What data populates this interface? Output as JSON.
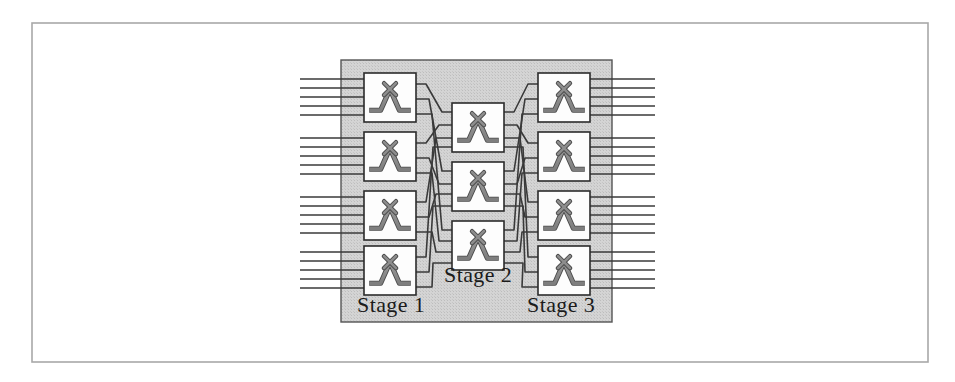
{
  "figure": {
    "outer_border": {
      "x": 32,
      "y": 23,
      "width": 896,
      "height": 339,
      "stroke": "#a8a8a8",
      "stroke_width": 1.6,
      "fill": "#ffffff"
    },
    "panel": {
      "x": 341,
      "y": 60,
      "width": 271,
      "height": 262,
      "fill": "#d2d2d2",
      "stroke": "#555555",
      "stroke_width": 1.4,
      "description": "halftone gray background panel enclosing all three stages"
    },
    "ink_color": "#303030",
    "line_color": "#3a3a3a",
    "switch_box": {
      "fill": "#fdfdfd",
      "stroke": "#2b2b2b",
      "stroke_width": 1.6,
      "glyph_color": "#8d8d8d",
      "glyph_outline": "#4a4a4a",
      "glyph_name": "crossbar-switch-glyph"
    },
    "labels": [
      {
        "id": "stage-1",
        "text": "Stage 1",
        "x": 357,
        "y": 312,
        "anchor": "start"
      },
      {
        "id": "stage-2",
        "text": "Stage 2",
        "x": 444,
        "y": 282,
        "anchor": "start"
      },
      {
        "id": "stage-3",
        "text": "Stage 3",
        "x": 527,
        "y": 312,
        "anchor": "start"
      }
    ],
    "topology": {
      "type": "clos-network",
      "stage1_switch_count": 4,
      "stage2_switch_count": 3,
      "stage3_switch_count": 4,
      "inputs_per_stage1_switch": 5,
      "outputs_per_stage3_switch": 5,
      "total_inputs": 20,
      "total_outputs": 20,
      "middle_links_per_switch": 3
    },
    "stage1_boxes": [
      {
        "id": "s1-sw-1",
        "x": 364,
        "y": 73,
        "width": 52,
        "height": 49
      },
      {
        "id": "s1-sw-2",
        "x": 364,
        "y": 132,
        "width": 52,
        "height": 49
      },
      {
        "id": "s1-sw-3",
        "x": 364,
        "y": 191,
        "width": 52,
        "height": 49
      },
      {
        "id": "s1-sw-4",
        "x": 364,
        "y": 246,
        "width": 52,
        "height": 49
      }
    ],
    "stage2_boxes": [
      {
        "id": "s2-sw-1",
        "x": 452,
        "y": 103,
        "width": 52,
        "height": 49
      },
      {
        "id": "s2-sw-2",
        "x": 452,
        "y": 162,
        "width": 52,
        "height": 49
      },
      {
        "id": "s2-sw-3",
        "x": 452,
        "y": 221,
        "width": 52,
        "height": 49
      }
    ],
    "stage3_boxes": [
      {
        "id": "s3-sw-1",
        "x": 538,
        "y": 73,
        "width": 52,
        "height": 49
      },
      {
        "id": "s3-sw-2",
        "x": 538,
        "y": 132,
        "width": 52,
        "height": 49
      },
      {
        "id": "s3-sw-3",
        "x": 538,
        "y": 191,
        "width": 52,
        "height": 49
      },
      {
        "id": "s3-sw-4",
        "x": 538,
        "y": 246,
        "width": 52,
        "height": 49
      }
    ],
    "input_line_x_start": 300,
    "input_line_x_end": 364,
    "output_line_x_start": 590,
    "output_line_x_end": 655,
    "input_group_y": [
      [
        79,
        88,
        97,
        106,
        115
      ],
      [
        138,
        147,
        156,
        165,
        174
      ],
      [
        197,
        206,
        215,
        224,
        233
      ],
      [
        252,
        261,
        270,
        279,
        288
      ]
    ],
    "output_group_y": [
      [
        79,
        88,
        97,
        106,
        115
      ],
      [
        138,
        147,
        156,
        165,
        174
      ],
      [
        197,
        206,
        215,
        224,
        233
      ],
      [
        252,
        261,
        270,
        279,
        288
      ]
    ],
    "stage1_out_y": [
      [
        84,
        99,
        114
      ],
      [
        143,
        158,
        173
      ],
      [
        202,
        217,
        232
      ],
      [
        257,
        272,
        287
      ]
    ],
    "stage2_in_y": [
      [
        112,
        125,
        138,
        147
      ],
      [
        171,
        184,
        194,
        206
      ],
      [
        230,
        241,
        252,
        263
      ]
    ],
    "stage2_out_y": [
      [
        112,
        125,
        138,
        147
      ],
      [
        171,
        184,
        194,
        206
      ],
      [
        230,
        241,
        252,
        263
      ]
    ],
    "stage3_in_y": [
      [
        84,
        99,
        114
      ],
      [
        143,
        158,
        173
      ],
      [
        202,
        217,
        232
      ],
      [
        257,
        272,
        287
      ]
    ]
  }
}
